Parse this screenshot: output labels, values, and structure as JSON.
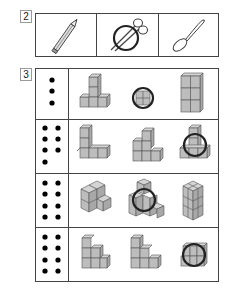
{
  "question2": {
    "number": "2",
    "items": [
      {
        "icon": "pencil-icon",
        "circled": false
      },
      {
        "icon": "scissors-icon",
        "circled": true
      },
      {
        "icon": "spoon-icon",
        "circled": false
      }
    ]
  },
  "question3": {
    "number": "3",
    "rows": [
      {
        "dot_count": 3,
        "dot_layout": "single-column",
        "options": [
          {
            "shape": "t-shape-4-cubes",
            "circled": false
          },
          {
            "shape": "single-square-block",
            "circled": true
          },
          {
            "shape": "tower-6-cubes",
            "circled": false
          }
        ]
      },
      {
        "dot_count": 7,
        "dot_layout": "two-columns",
        "options": [
          {
            "shape": "l-shape-cubes",
            "circled": false
          },
          {
            "shape": "steps-cubes",
            "circled": false
          },
          {
            "shape": "base-with-tower-cubes",
            "circled": true
          }
        ]
      },
      {
        "dot_count": 8,
        "dot_layout": "two-columns",
        "options": [
          {
            "shape": "isometric-l-cubes",
            "circled": false
          },
          {
            "shape": "isometric-stack-cubes",
            "circled": true
          },
          {
            "shape": "isometric-block-cubes",
            "circled": false
          }
        ]
      },
      {
        "dot_count": 8,
        "dot_layout": "two-columns",
        "options": [
          {
            "shape": "stair-cubes-a",
            "circled": false
          },
          {
            "shape": "stair-cubes-b",
            "circled": false
          },
          {
            "shape": "flat-block-cubes",
            "circled": true
          }
        ]
      }
    ]
  }
}
